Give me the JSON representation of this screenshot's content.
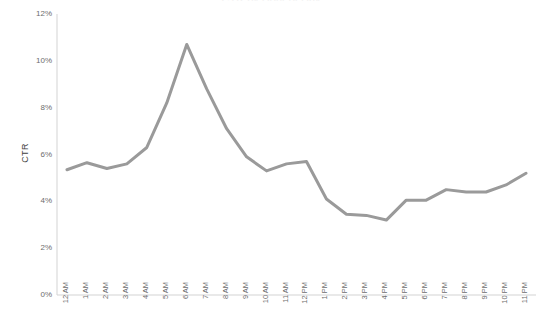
{
  "chart_data": {
    "type": "line",
    "title": "",
    "xlabel": "",
    "ylabel": "CTR",
    "ylim": [
      0,
      12
    ],
    "ytick_labels": [
      "0%",
      "2%",
      "4%",
      "6%",
      "8%",
      "10%",
      "12%"
    ],
    "ytick_values": [
      0,
      2,
      4,
      6,
      8,
      10,
      12
    ],
    "grid": false,
    "legend": "none",
    "markers": false,
    "line_color": "#9a9a9a",
    "line_width": 3,
    "categories": [
      "12 AM",
      "1 AM",
      "2 AM",
      "3 AM",
      "4 AM",
      "5 AM",
      "6 AM",
      "7 AM",
      "8 AM",
      "9 AM",
      "10 AM",
      "11 AM",
      "12 PM",
      "1 PM",
      "2 PM",
      "3 PM",
      "4 PM",
      "5 PM",
      "6 PM",
      "7 PM",
      "8 PM",
      "9 PM",
      "10 PM",
      "11 PM"
    ],
    "values": [
      5.35,
      5.65,
      5.4,
      5.6,
      6.3,
      8.2,
      10.7,
      8.8,
      7.1,
      5.9,
      5.3,
      5.6,
      5.7,
      4.1,
      3.45,
      3.4,
      3.2,
      4.05,
      4.05,
      4.5,
      4.4,
      4.4,
      4.7,
      5.2
    ]
  },
  "axis": {
    "y_label": "CTR"
  },
  "title_bar": {
    "cut_off_title": "CTR by Hour of Day"
  }
}
